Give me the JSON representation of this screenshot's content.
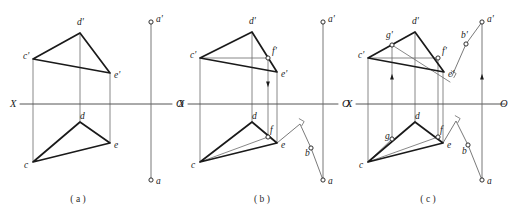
{
  "figure": {
    "background": "#ffffff",
    "ink": "#1a1a1a",
    "thin_ink": "#6a6a6a",
    "axis_ink": "#555555",
    "panels": [
      {
        "id": "a",
        "caption": "( a )",
        "caption_x": 78,
        "caption_y": 202,
        "axis": {
          "label_left": "X",
          "label_right": "O",
          "x1": 20,
          "x2": 172,
          "y": 104,
          "left_label_x": 10,
          "left_label_y": 107,
          "right_label_x": 176,
          "right_label_y": 107
        },
        "top_triangle": {
          "c": [
            33,
            59
          ],
          "d": [
            80,
            33
          ],
          "e": [
            110,
            73
          ]
        },
        "bottom_triangle": {
          "c": [
            33,
            162
          ],
          "d": [
            80,
            122
          ],
          "e": [
            110,
            143
          ]
        },
        "vertical_connectors": [
          {
            "x": 33,
            "y1": 59,
            "y2": 162
          },
          {
            "x": 80,
            "y1": 33,
            "y2": 122
          },
          {
            "x": 110,
            "y1": 73,
            "y2": 143
          }
        ],
        "line_ab": {
          "x": 151,
          "a_prime": [
            151,
            22
          ],
          "a": [
            151,
            180
          ]
        },
        "points": [
          {
            "name": "c-prime",
            "label": "c'",
            "x": 33,
            "y": 59,
            "lx": 23,
            "ly": 59,
            "marker": false
          },
          {
            "name": "d-prime",
            "label": "d'",
            "x": 80,
            "y": 33,
            "lx": 77,
            "ly": 25,
            "marker": false
          },
          {
            "name": "e-prime",
            "label": "e'",
            "x": 110,
            "y": 73,
            "lx": 114,
            "ly": 78,
            "marker": false
          },
          {
            "name": "c",
            "label": "c",
            "x": 33,
            "y": 162,
            "lx": 24,
            "ly": 168,
            "marker": false
          },
          {
            "name": "d",
            "label": "d",
            "x": 80,
            "y": 122,
            "lx": 80,
            "ly": 119,
            "marker": false
          },
          {
            "name": "e",
            "label": "e",
            "x": 110,
            "y": 143,
            "lx": 114,
            "ly": 148,
            "marker": false
          },
          {
            "name": "a-prime",
            "label": "a'",
            "x": 151,
            "y": 22,
            "lx": 156,
            "ly": 22,
            "marker": true
          },
          {
            "name": "a",
            "label": "a",
            "x": 151,
            "y": 180,
            "lx": 156,
            "ly": 184,
            "marker": true
          }
        ]
      },
      {
        "id": "b",
        "caption": "( b )",
        "caption_x": 262,
        "caption_y": 202,
        "axis": {
          "label_left": "X",
          "label_right": "O",
          "x1": 188,
          "x2": 338,
          "y": 104,
          "left_label_x": 178,
          "left_label_y": 107,
          "right_label_x": 342,
          "right_label_y": 107
        },
        "top_triangle": {
          "c": [
            200,
            58
          ],
          "d": [
            252,
            32
          ],
          "e": [
            277,
            72
          ]
        },
        "bottom_triangle": {
          "c": [
            200,
            162
          ],
          "d": [
            252,
            122
          ],
          "e": [
            277,
            143
          ]
        },
        "vertical_connectors": [
          {
            "x": 200,
            "y1": 58,
            "y2": 162
          },
          {
            "x": 252,
            "y1": 32,
            "y2": 122
          },
          {
            "x": 277,
            "y1": 72,
            "y2": 143
          }
        ],
        "aux_point_f": {
          "f_prime": [
            268,
            58
          ],
          "f": [
            268,
            137
          ],
          "recall_line_top": {
            "from": [
              200,
              58
            ],
            "to": [
              268,
              58
            ]
          },
          "recall_line_bottom": {
            "from": [
              200,
              162
            ],
            "to": [
              268,
              137
            ]
          },
          "connector": {
            "x": 268,
            "y1": 58,
            "y2": 137
          },
          "arrow_y": 86
        },
        "line_ab": {
          "x": 323,
          "a_prime": [
            323,
            22
          ],
          "a": [
            323,
            180
          ],
          "b_poly": [
            [
              277,
              143
            ],
            [
              300,
              124
            ],
            [
              311,
              148
            ],
            [
              323,
              180
            ]
          ],
          "b_point": [
            311,
            148
          ],
          "right_angle_at": [
            300,
            124
          ]
        },
        "points": [
          {
            "name": "c-prime",
            "label": "c'",
            "x": 200,
            "y": 58,
            "lx": 190,
            "ly": 58,
            "marker": false
          },
          {
            "name": "d-prime",
            "label": "d'",
            "x": 252,
            "y": 32,
            "lx": 249,
            "ly": 24,
            "marker": false
          },
          {
            "name": "f-prime",
            "label": "f'",
            "x": 268,
            "y": 58,
            "lx": 272,
            "ly": 54,
            "marker": true
          },
          {
            "name": "e-prime",
            "label": "e'",
            "x": 277,
            "y": 72,
            "lx": 281,
            "ly": 77,
            "marker": false
          },
          {
            "name": "c",
            "label": "c",
            "x": 200,
            "y": 162,
            "lx": 191,
            "ly": 168,
            "marker": false
          },
          {
            "name": "d",
            "label": "d",
            "x": 252,
            "y": 122,
            "lx": 252,
            "ly": 119,
            "marker": false
          },
          {
            "name": "f",
            "label": "f",
            "x": 268,
            "y": 137,
            "lx": 270,
            "ly": 133,
            "marker": true
          },
          {
            "name": "e",
            "label": "e",
            "x": 277,
            "y": 143,
            "lx": 281,
            "ly": 148,
            "marker": false
          },
          {
            "name": "a-prime",
            "label": "a'",
            "x": 323,
            "y": 22,
            "lx": 328,
            "ly": 22,
            "marker": true
          },
          {
            "name": "a",
            "label": "a",
            "x": 323,
            "y": 180,
            "lx": 328,
            "ly": 184,
            "marker": true
          },
          {
            "name": "b",
            "label": "b",
            "x": 311,
            "y": 148,
            "lx": 305,
            "ly": 156,
            "marker": true
          }
        ]
      },
      {
        "id": "c",
        "caption": "( c )",
        "caption_x": 428,
        "caption_y": 202,
        "axis": {
          "label_left": "X",
          "label_right": "O",
          "x1": 356,
          "x2": 505,
          "y": 104,
          "left_label_x": 346,
          "left_label_y": 107,
          "right_label_x": 500,
          "right_label_y": 107
        },
        "top_triangle": {
          "c": [
            368,
            58
          ],
          "d": [
            415,
            32
          ],
          "e": [
            444,
            72
          ]
        },
        "bottom_triangle": {
          "c": [
            368,
            162
          ],
          "d": [
            415,
            122
          ],
          "e": [
            443,
            143
          ]
        },
        "vertical_connectors": [
          {
            "x": 368,
            "y1": 58,
            "y2": 162
          },
          {
            "x": 415,
            "y1": 32,
            "y2": 122
          },
          {
            "x": 443,
            "y1": 72,
            "y2": 143
          }
        ],
        "aux_point_f": {
          "f_prime": [
            438,
            58
          ],
          "f": [
            438,
            137
          ],
          "recall_line_top": {
            "from": [
              368,
              58
            ],
            "to": [
              438,
              58
            ]
          },
          "recall_line_bottom": {
            "from": [
              368,
              162
            ],
            "to": [
              438,
              137
            ]
          },
          "connector": {
            "x": 438,
            "y1": 58,
            "y2": 137
          }
        },
        "aux_point_g": {
          "g_prime": [
            392,
            45
          ],
          "g": [
            392,
            139
          ],
          "connector": {
            "x": 392,
            "y1": 45,
            "y2": 139
          },
          "arrow_y": 75,
          "sight_line_top": {
            "from": [
              392,
              45
            ],
            "to": [
              450,
              82
            ]
          },
          "sight_line_bottom": {
            "from": [
              392,
              139
            ],
            "to": [
              368,
              162
            ]
          }
        },
        "line_ab": {
          "x": 482,
          "a_prime": [
            482,
            22
          ],
          "a": [
            482,
            180
          ],
          "b_prime": [
            466,
            44
          ],
          "b": [
            468,
            145
          ],
          "b_poly_top": [
            [
              482,
              22
            ],
            [
              466,
              44
            ],
            [
              452,
              76
            ]
          ],
          "b_poly_bottom": [
            [
              443,
              143
            ],
            [
              456,
              121
            ],
            [
              468,
              145
            ],
            [
              482,
              180
            ]
          ],
          "arrow_y": 75,
          "right_angle_top": [
            452,
            76
          ],
          "right_angle_bottom": [
            456,
            121
          ]
        },
        "points": [
          {
            "name": "c-prime",
            "label": "c'",
            "x": 368,
            "y": 58,
            "lx": 358,
            "ly": 58,
            "marker": false
          },
          {
            "name": "g-prime",
            "label": "g'",
            "x": 392,
            "y": 45,
            "lx": 386,
            "ly": 38,
            "marker": true
          },
          {
            "name": "d-prime",
            "label": "d'",
            "x": 415,
            "y": 32,
            "lx": 412,
            "ly": 24,
            "marker": false
          },
          {
            "name": "f-prime",
            "label": "f'",
            "x": 438,
            "y": 58,
            "lx": 442,
            "ly": 54,
            "marker": true
          },
          {
            "name": "e-prime",
            "label": "e'",
            "x": 444,
            "y": 72,
            "lx": 448,
            "ly": 77,
            "marker": false
          },
          {
            "name": "c",
            "label": "c",
            "x": 368,
            "y": 162,
            "lx": 359,
            "ly": 168,
            "marker": false
          },
          {
            "name": "g",
            "label": "g",
            "x": 392,
            "y": 139,
            "lx": 385,
            "ly": 139,
            "marker": true
          },
          {
            "name": "d",
            "label": "d",
            "x": 415,
            "y": 122,
            "lx": 415,
            "ly": 119,
            "marker": false
          },
          {
            "name": "f",
            "label": "f",
            "x": 438,
            "y": 137,
            "lx": 440,
            "ly": 133,
            "marker": true
          },
          {
            "name": "e",
            "label": "e",
            "x": 443,
            "y": 143,
            "lx": 447,
            "ly": 148,
            "marker": false
          },
          {
            "name": "a-prime",
            "label": "a'",
            "x": 482,
            "y": 22,
            "lx": 487,
            "ly": 22,
            "marker": true
          },
          {
            "name": "b-prime",
            "label": "b'",
            "x": 466,
            "y": 44,
            "lx": 461,
            "ly": 38,
            "marker": true
          },
          {
            "name": "b",
            "label": "b",
            "x": 468,
            "y": 145,
            "lx": 462,
            "ly": 154,
            "marker": true
          },
          {
            "name": "a",
            "label": "a",
            "x": 482,
            "y": 180,
            "lx": 487,
            "ly": 184,
            "marker": true
          }
        ]
      }
    ]
  }
}
